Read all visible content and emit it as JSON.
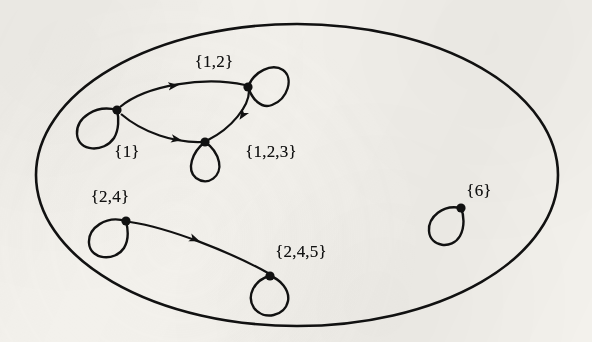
{
  "figure": {
    "name": "directed-graph-of-sets-in-ellipse",
    "background_color": "#f3f1ec",
    "ink_color": "#111111"
  },
  "boundary": {
    "shape": "ellipse",
    "cx": 297,
    "cy": 175,
    "rx": 261,
    "ry": 151,
    "stroke_width": 2.6
  },
  "nodes": [
    {
      "id": "s1",
      "label": "{1}",
      "x": 117,
      "y": 110,
      "label_x": 127,
      "label_y": 151,
      "loop": "lower-left"
    },
    {
      "id": "s12",
      "label": "{1,2}",
      "x": 248,
      "y": 87,
      "label_x": 214,
      "label_y": 61,
      "loop": "right"
    },
    {
      "id": "s123",
      "label": "{1,2,3}",
      "x": 205,
      "y": 142,
      "label_x": 271,
      "label_y": 151,
      "loop": "below"
    },
    {
      "id": "s24",
      "label": "{2,4}",
      "x": 126,
      "y": 221,
      "label_x": 110,
      "label_y": 196,
      "loop": "lower-left"
    },
    {
      "id": "s245",
      "label": "{2,4,5}",
      "x": 270,
      "y": 276,
      "label_x": 301,
      "label_y": 251,
      "loop": "below"
    },
    {
      "id": "s6",
      "label": "{6}",
      "x": 461,
      "y": 208,
      "label_x": 479,
      "label_y": 190,
      "loop": "lower-left"
    }
  ],
  "edges": [
    {
      "from": "s1",
      "to": "s12",
      "label": "",
      "curve": "arc-up"
    },
    {
      "from": "s1",
      "to": "s123",
      "label": "",
      "curve": "arc-down"
    },
    {
      "from": "s12",
      "to": "s123",
      "label": "",
      "curve": "arc-short"
    },
    {
      "from": "s24",
      "to": "s245",
      "label": "",
      "curve": "arc-down-long"
    }
  ],
  "self_loops": [
    {
      "node": "s1",
      "direction": "lower-left"
    },
    {
      "node": "s12",
      "direction": "right"
    },
    {
      "node": "s123",
      "direction": "below"
    },
    {
      "node": "s24",
      "direction": "lower-left"
    },
    {
      "node": "s245",
      "direction": "below"
    },
    {
      "node": "s6",
      "direction": "lower-left"
    }
  ]
}
